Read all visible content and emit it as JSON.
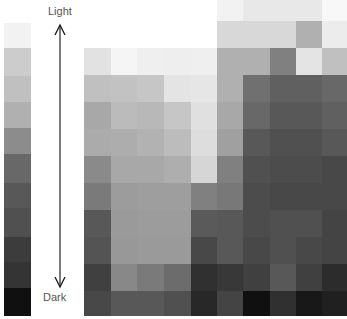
{
  "labels": {
    "top": "Light",
    "bottom": "Dark"
  },
  "scale_bar": {
    "segments": [
      {
        "top": 0,
        "height": 25,
        "color": "#f2f2f2"
      },
      {
        "top": 25,
        "height": 28,
        "color": "#cccccc"
      },
      {
        "top": 53,
        "height": 26,
        "color": "#c0c0c0"
      },
      {
        "top": 79,
        "height": 26,
        "color": "#b0b0b0"
      },
      {
        "top": 105,
        "height": 26,
        "color": "#8c8c8c"
      },
      {
        "top": 131,
        "height": 29,
        "color": "#686868"
      },
      {
        "top": 160,
        "height": 25,
        "color": "#585858"
      },
      {
        "top": 185,
        "height": 29,
        "color": "#505050"
      },
      {
        "top": 214,
        "height": 25,
        "color": "#3c3c3c"
      },
      {
        "top": 239,
        "height": 26,
        "color": "#343434"
      },
      {
        "top": 265,
        "height": 28,
        "color": "#101010"
      }
    ]
  },
  "grid": {
    "col_edges": [
      0,
      27,
      53,
      80,
      107,
      133,
      159,
      186,
      212,
      238,
      263
    ],
    "row_edges": [
      0,
      21,
      48,
      75,
      102,
      129,
      156,
      183,
      210,
      237,
      264,
      291,
      316
    ],
    "rows": [
      [
        "#ffffff",
        "#ffffff",
        "#ffffff",
        "#ffffff",
        "#ffffff",
        "#f2f2f2",
        "#e8e8e8",
        "#e8e8e8",
        "#e8e8e8",
        "#f8f8f8"
      ],
      [
        "#ffffff",
        "#ffffff",
        "#ffffff",
        "#ffffff",
        "#ffffff",
        "#d8d8d8",
        "#d8d8d8",
        "#d8d8d8",
        "#b0b0b0",
        "#ececec"
      ],
      [
        "#e2e2e2",
        "#f5f5f5",
        "#efefef",
        "#eeeeee",
        "#efefef",
        "#b0b0b0",
        "#b0b0b0",
        "#808080",
        "#e4e4e4",
        "#c0c0c0"
      ],
      [
        "#c0c0c0",
        "#c2c2c2",
        "#c6c6c6",
        "#e4e4e4",
        "#e6e6e6",
        "#b0b0b0",
        "#707070",
        "#606060",
        "#606060",
        "#686868"
      ],
      [
        "#a8a8a8",
        "#bbbbbb",
        "#b8b8b8",
        "#c6c6c6",
        "#e0e0e0",
        "#a8a8a8",
        "#686868",
        "#585858",
        "#585858",
        "#606060"
      ],
      [
        "#ababab",
        "#adadad",
        "#b2b2b2",
        "#bcbcbc",
        "#dddddd",
        "#a0a0a0",
        "#585858",
        "#505050",
        "#505050",
        "#585858"
      ],
      [
        "#8a8a8a",
        "#a8a8a8",
        "#a8a8a8",
        "#aeaeae",
        "#d6d6d6",
        "#808080",
        "#505050",
        "#4c4c4c",
        "#4c4c4c",
        "#484848"
      ],
      [
        "#7a7a7a",
        "#9c9c9c",
        "#9e9e9e",
        "#9e9e9e",
        "#808080",
        "#787878",
        "#4c4c4c",
        "#484848",
        "#484848",
        "#484848"
      ],
      [
        "#585858",
        "#9a9a9a",
        "#9c9c9c",
        "#9c9c9c",
        "#5a5a5a",
        "#585858",
        "#4c4c4c",
        "#505050",
        "#505050",
        "#444444"
      ],
      [
        "#545454",
        "#989898",
        "#9a9a9a",
        "#9a9a9a",
        "#484848",
        "#585858",
        "#484848",
        "#505050",
        "#484848",
        "#444444"
      ],
      [
        "#404040",
        "#888888",
        "#7a7a7a",
        "#6c6c6c",
        "#303030",
        "#383838",
        "#404040",
        "#585858",
        "#404040",
        "#2c2c2c"
      ],
      [
        "#484848",
        "#585858",
        "#585858",
        "#505050",
        "#282828",
        "#444444",
        "#101010",
        "#303030",
        "#181818",
        "#202020"
      ]
    ]
  }
}
